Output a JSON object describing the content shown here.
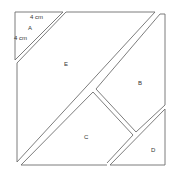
{
  "diagram": {
    "line_color": "#6e6e6e",
    "pieces": [
      {
        "id": "A",
        "label": "A",
        "shape": "right-triangle",
        "position": "top-left"
      },
      {
        "id": "B",
        "label": "B",
        "shape": "trapezoid",
        "position": "upper-right"
      },
      {
        "id": "C",
        "label": "C",
        "shape": "triangle",
        "position": "bottom-center"
      },
      {
        "id": "D",
        "label": "D",
        "shape": "right-triangle",
        "position": "bottom-right"
      },
      {
        "id": "E",
        "label": "E",
        "shape": "pentagon",
        "position": "center-left"
      }
    ],
    "dimensions": {
      "top_side_label": "4 cm",
      "left_side_label": "4 cm"
    }
  }
}
